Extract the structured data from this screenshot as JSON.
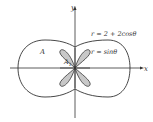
{
  "diagram": {
    "axes": {
      "x_label": "x",
      "y_label": "y"
    },
    "curves": [
      {
        "name": "outer",
        "equation": "r = 2 + 2cosθ",
        "label": "r = 2 + 2cosθ"
      },
      {
        "name": "inner",
        "equation": "r = sinθ",
        "label": "r = sinθ",
        "fill": "#c8c8c8"
      }
    ],
    "regions": [
      {
        "label": "A"
      },
      {
        "label": "A",
        "subscript": "1"
      }
    ],
    "colors": {
      "stroke": "#333333",
      "shaded": "#c8c8c8",
      "background": "#ffffff"
    }
  }
}
